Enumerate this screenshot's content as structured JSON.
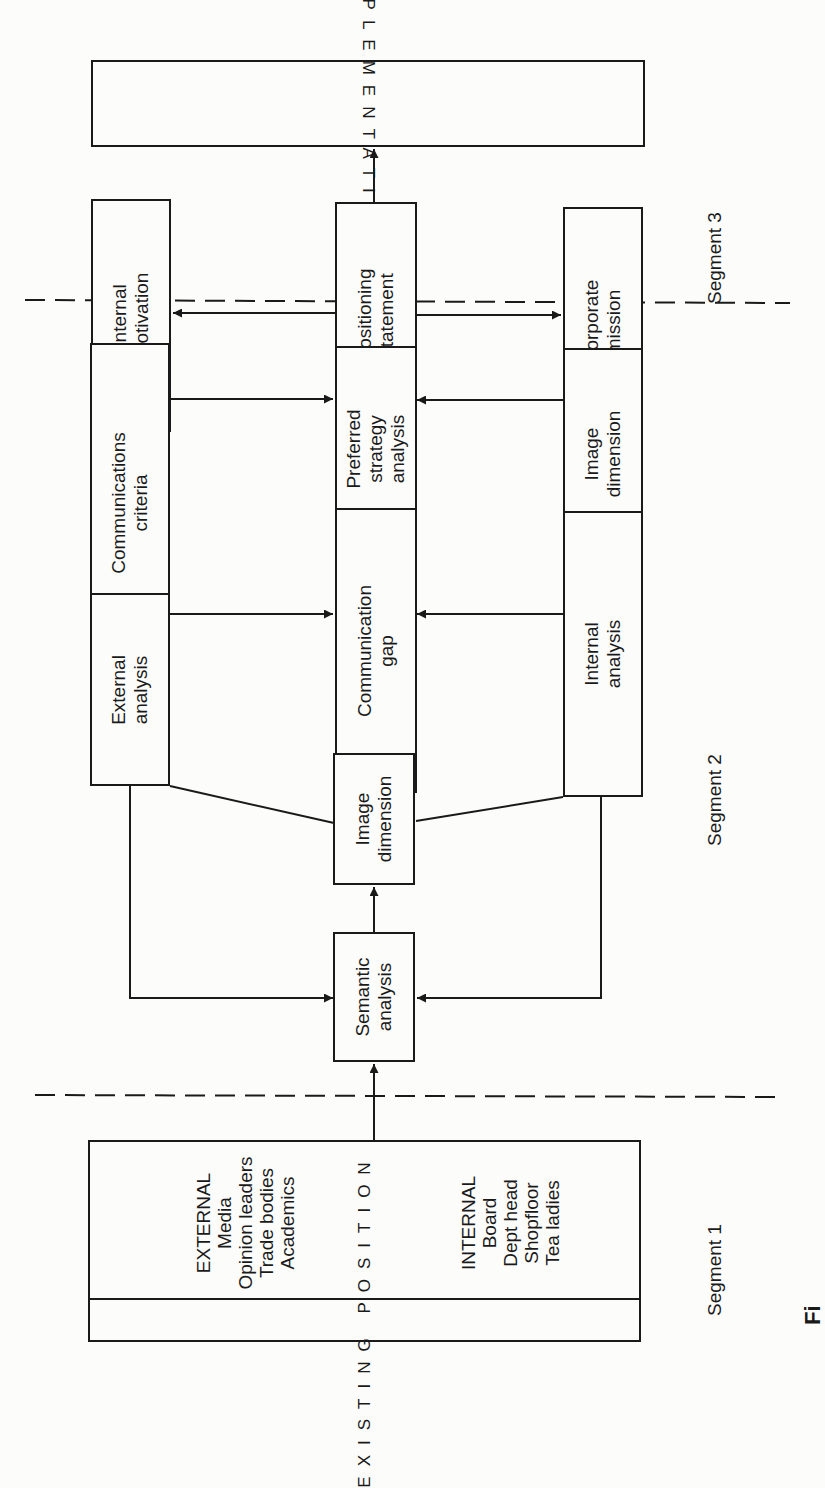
{
  "diagram": {
    "orientation": "rotated -90deg (reads bottom to top)",
    "segments": [
      {
        "id": "segment-1",
        "label": "Segment 1"
      },
      {
        "id": "segment-2",
        "label": "Segment 2"
      },
      {
        "id": "segment-3",
        "label": "Segment 3"
      }
    ],
    "nodes": {
      "implementation": {
        "label": "IMPLEMENTATION"
      },
      "internal_motivation": {
        "lines": [
          "Internal",
          "motivation"
        ]
      },
      "positioning_statement": {
        "lines": [
          "Positioning",
          "statement"
        ]
      },
      "corporate_mission": {
        "lines": [
          "Corporate",
          "mission"
        ]
      },
      "communications_criteria": {
        "lines": [
          "Communications",
          "criteria"
        ]
      },
      "preferred_strategy_analysis": {
        "lines": [
          "Preferred",
          "strategy",
          "analysis"
        ]
      },
      "image_dimension_top": {
        "lines": [
          "Image",
          "dimension"
        ]
      },
      "external_analysis": {
        "lines": [
          "External",
          "analysis"
        ]
      },
      "communication_gap": {
        "lines": [
          "Communication",
          "gap"
        ]
      },
      "internal_analysis": {
        "lines": [
          "Internal",
          "analysis"
        ]
      },
      "image_dimension_mid": {
        "lines": [
          "Image",
          "dimension"
        ]
      },
      "semantic_analysis": {
        "lines": [
          "Semantic",
          "analysis"
        ]
      },
      "existing_position": {
        "label": "EXISTING POSITION",
        "external": {
          "heading": "EXTERNAL",
          "items": [
            "Media",
            "Opinion leaders",
            "Trade bodies",
            "Academics"
          ]
        },
        "internal": {
          "heading": "INTERNAL",
          "items": [
            "Board",
            "Dept head",
            "Shopfloor",
            "Tea ladies"
          ]
        }
      }
    },
    "edges": [
      {
        "from": "existing_position",
        "to": "semantic_analysis"
      },
      {
        "from": "external_analysis",
        "to": "semantic_analysis"
      },
      {
        "from": "internal_analysis",
        "to": "semantic_analysis"
      },
      {
        "from": "semantic_analysis",
        "to": "image_dimension_mid"
      },
      {
        "from": "image_dimension_mid",
        "to": "external_analysis",
        "type": "line"
      },
      {
        "from": "image_dimension_mid",
        "to": "internal_analysis",
        "type": "line"
      },
      {
        "from": "external_analysis",
        "to": "communication_gap"
      },
      {
        "from": "internal_analysis",
        "to": "communication_gap"
      },
      {
        "from": "communication_gap",
        "to": "preferred_strategy_analysis"
      },
      {
        "from": "communications_criteria",
        "to": "preferred_strategy_analysis"
      },
      {
        "from": "image_dimension_top",
        "to": "preferred_strategy_analysis"
      },
      {
        "from": "preferred_strategy_analysis",
        "to": "positioning_statement"
      },
      {
        "from": "positioning_statement",
        "to": "internal_motivation"
      },
      {
        "from": "positioning_statement",
        "to": "corporate_mission"
      },
      {
        "from": "positioning_statement",
        "to": "implementation"
      }
    ],
    "caption_fragment": "Fi"
  }
}
